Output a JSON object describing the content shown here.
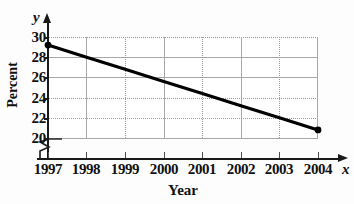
{
  "chart_data": {
    "type": "line",
    "title": "",
    "xlabel": "Year",
    "ylabel": "Percent",
    "x_axis_variable": "x",
    "y_axis_variable": "y",
    "x": [
      1997,
      1998,
      1999,
      2000,
      2001,
      2002,
      2003,
      2004
    ],
    "xtick_labels": [
      "1997",
      "1998",
      "1999",
      "2000",
      "2001",
      "2002",
      "2003",
      "2004"
    ],
    "ytick_labels": [
      "30",
      "28",
      "26",
      "24",
      "22",
      "20"
    ],
    "ytick_values": [
      30,
      28,
      26,
      24,
      22,
      20
    ],
    "ylim": [
      20,
      30
    ],
    "xlim": [
      1997,
      2004
    ],
    "y_axis_break": true,
    "grid": true,
    "legend": false,
    "series": [
      {
        "name": "Percent",
        "endpoints_marked": true,
        "values": [
          29.2,
          28.0,
          26.8,
          25.6,
          24.4,
          23.2,
          22.0,
          20.8
        ]
      }
    ],
    "annotations": []
  },
  "figure": {
    "background_color": "#fdfdfd",
    "plot_background_color": "#ffffff",
    "line_color": "#000000",
    "grid_color": "#a8a8a8",
    "axis_color": "#1a1a1a"
  }
}
